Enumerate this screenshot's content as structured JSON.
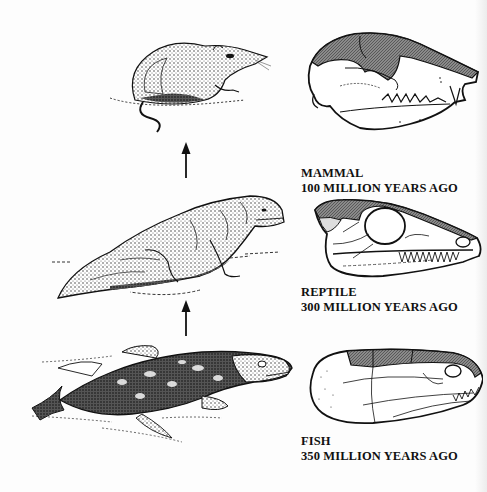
{
  "figure": {
    "stages": [
      {
        "animal": "mammal-shrew",
        "skull": "mammal-skull",
        "name": "MAMMAL",
        "age": "100 MILLION YEARS AGO"
      },
      {
        "animal": "reptile-lizard",
        "skull": "reptile-skull",
        "name": "REPTILE",
        "age": "300 MILLION YEARS AGO"
      },
      {
        "animal": "lobe-finned-fish",
        "skull": "fish-skull",
        "name": "FISH",
        "age": "350 MILLION YEARS AGO"
      }
    ],
    "arrows": [
      {
        "direction": "up",
        "from": "REPTILE",
        "to": "MAMMAL"
      },
      {
        "direction": "up",
        "from": "FISH",
        "to": "REPTILE"
      }
    ],
    "colors": {
      "ink": "#111111",
      "shaded_bone": "#6e6e6e",
      "background": "#fdfdfd"
    }
  }
}
